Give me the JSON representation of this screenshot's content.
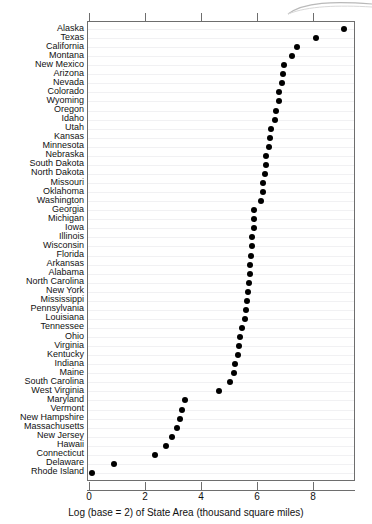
{
  "chart_data": {
    "type": "scatter",
    "title": "",
    "subtitle": "",
    "xlabel": "Log (base = 2) of State Area (thousand square miles)",
    "ylabel": "",
    "xlim": [
      -0.35,
      9.2
    ],
    "xticks": [
      0,
      2,
      4,
      6,
      8
    ],
    "xticklabels": [
      "0",
      "2",
      "4",
      "6",
      "8"
    ],
    "grid": "horizontal",
    "legend": "none",
    "orientation": "horizontal-dotplot",
    "marker": {
      "shape": "circle",
      "color": "#000000",
      "size": 6
    },
    "categories": [
      "Alaska",
      "Texas",
      "California",
      "Montana",
      "New Mexico",
      "Arizona",
      "Nevada",
      "Colorado",
      "Wyoming",
      "Oregon",
      "Idaho",
      "Utah",
      "Kansas",
      "Minnesota",
      "Nebraska",
      "South Dakota",
      "North Dakota",
      "Missouri",
      "Oklahoma",
      "Washington",
      "Georgia",
      "Michigan",
      "Iowa",
      "Illinois",
      "Wisconsin",
      "Florida",
      "Arkansas",
      "Alabama",
      "North Carolina",
      "New York",
      "Mississippi",
      "Pennsylvania",
      "Louisiana",
      "Tennessee",
      "Ohio",
      "Virginia",
      "Kentucky",
      "Indiana",
      "Maine",
      "South Carolina",
      "West Virginia",
      "Maryland",
      "Vermont",
      "New Hampshire",
      "Massachusetts",
      "New Jersey",
      "Hawaii",
      "Connecticut",
      "Delaware",
      "Rhode Island"
    ],
    "values": [
      9.07,
      8.06,
      7.39,
      7.22,
      6.93,
      6.89,
      6.85,
      6.76,
      6.76,
      6.64,
      6.61,
      6.46,
      6.42,
      6.39,
      6.28,
      6.27,
      6.25,
      6.18,
      6.17,
      6.12,
      5.87,
      5.85,
      5.84,
      5.8,
      5.78,
      5.76,
      5.73,
      5.71,
      5.67,
      5.63,
      5.6,
      5.57,
      5.52,
      5.42,
      5.35,
      5.33,
      5.28,
      5.18,
      5.15,
      5.01,
      4.6,
      3.41,
      3.3,
      3.23,
      3.12,
      2.94,
      2.72,
      2.31,
      0.85,
      0.07
    ],
    "units_note": "Log (base = 2) of State Area (thousand square miles)"
  },
  "axis": {
    "x_title": "Log (base = 2) of State Area (thousand square miles)"
  }
}
